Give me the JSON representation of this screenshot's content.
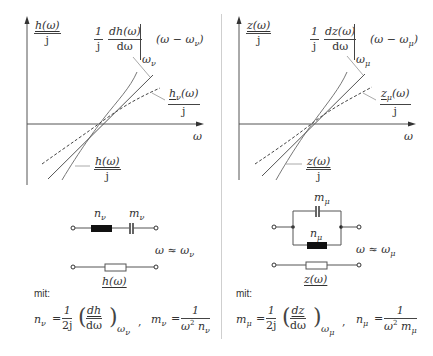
{
  "left": {
    "y_axis_label": {
      "num": "h(ω)",
      "den": "j"
    },
    "derivative_label": {
      "prefix_num": "1",
      "prefix_den": "j",
      "num": "dh(ω)",
      "den": "dω",
      "eval_at": "ω",
      "eval_sub": "ν",
      "suffix": "(ω − ω",
      "suffix_sub": "ν",
      "suffix_close": ")"
    },
    "approx_label": {
      "num": "h",
      "num_sub": "ν",
      "num_rest": "(ω)",
      "den": "j"
    },
    "curve_label": {
      "num": "h(ω)",
      "den": "j"
    },
    "x_axis_label": "ω",
    "circuit": {
      "element1_label": "n",
      "element1_sub": "ν",
      "element2_label": "m",
      "element2_sub": "ν",
      "approx_condition": "ω ≈ ω",
      "approx_sub": "ν",
      "impedance_label": "h(ω)"
    },
    "mit_label": "mit:",
    "formula": {
      "lhs": "n",
      "lhs_sub": "ν",
      "eq": "=",
      "coef_num": "1",
      "coef_den": "2j",
      "deriv_num": "dh",
      "deriv_den": "dω",
      "eval": "ω",
      "eval_sub": "ν",
      "sep": ",",
      "lhs2": "m",
      "lhs2_sub": "ν",
      "eq2": "=",
      "frac2_num": "1",
      "frac2_den_a": "ω",
      "frac2_den_a_sub": "ν",
      "frac2_den_a_sup": "2",
      "frac2_den_b": "n",
      "frac2_den_b_sub": "ν"
    }
  },
  "right": {
    "y_axis_label": {
      "num": "z(ω)",
      "den": "j"
    },
    "derivative_label": {
      "prefix_num": "1",
      "prefix_den": "j",
      "num": "dz(ω)",
      "den": "dω",
      "eval_at": "ω",
      "eval_sub": "μ",
      "suffix": "(ω − ω",
      "suffix_sub": "μ",
      "suffix_close": ")"
    },
    "approx_label": {
      "num": "z",
      "num_sub": "μ",
      "num_rest": "(ω)",
      "den": "j"
    },
    "curve_label": {
      "num": "z(ω)",
      "den": "j"
    },
    "x_axis_label": "ω",
    "circuit": {
      "element1_label": "m",
      "element1_sub": "μ",
      "element2_label": "n",
      "element2_sub": "μ",
      "approx_condition": "ω ≈ ω",
      "approx_sub": "μ",
      "impedance_label": "z(ω)"
    },
    "mit_label": "mit:",
    "formula": {
      "lhs": "m",
      "lhs_sub": "μ",
      "eq": "=",
      "coef_num": "1",
      "coef_den": "2j",
      "deriv_num": "dz",
      "deriv_den": "dω",
      "eval": "ω",
      "eval_sub": "μ",
      "sep": ",",
      "lhs2": "n",
      "lhs2_sub": "μ",
      "eq2": "=",
      "frac2_num": "1",
      "frac2_den_a": "ω",
      "frac2_den_a_sub": "μ",
      "frac2_den_a_sup": "2",
      "frac2_den_b": "m",
      "frac2_den_b_sub": "μ"
    }
  },
  "colors": {
    "axis": "#555555",
    "curve": "#777777",
    "tangent": "#555555",
    "dashed": "#444444",
    "element_fill": "#111111",
    "divider": "#cfcfcf"
  }
}
